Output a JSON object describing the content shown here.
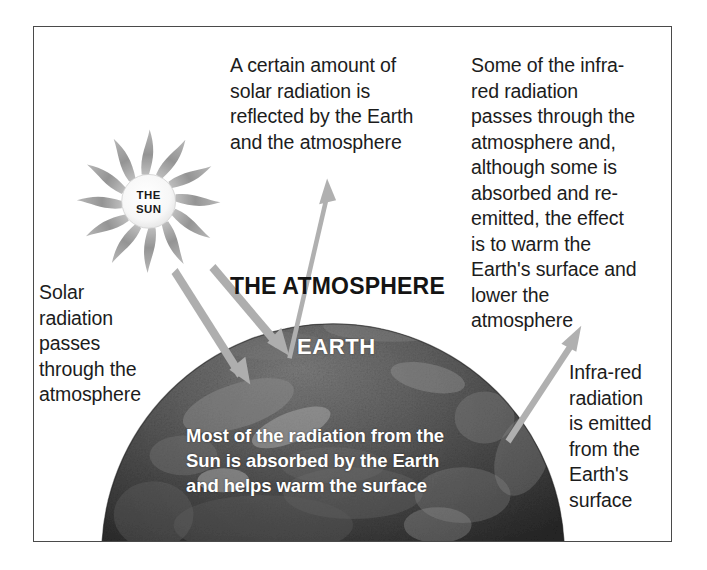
{
  "diagram": {
    "frame": {
      "border_color": "#4a4a4a",
      "background": "#ffffff"
    },
    "sun": {
      "name": "the-sun",
      "line1": "THE",
      "line2": "SUN",
      "ray_count": 12,
      "ray_color": "#9a9a9a",
      "disc_color": "#fbfbfb"
    },
    "earth": {
      "name": "earth-globe",
      "label": "EARTH",
      "base_color": "#4d4d4d",
      "shadow_color": "#2a2a2a",
      "highlight_color": "#bdbdbd"
    },
    "atmosphere_label": "THE ATMOSPHERE",
    "captions": {
      "reflected": "A certain amount of\nsolar radiation is\nreflected by the Earth\nand the atmosphere",
      "infrared_through": "Some of the infra-\nred radiation\npasses through the\natmosphere and,\nalthough some is\nabsorbed and re-\nemitted, the effect\nis to warm the\nEarth's surface and\nlower the\natmosphere",
      "solar_passes": "Solar\nradiation\npasses\nthrough the\natmosphere",
      "infrared_emitted": "Infra-red\nradiation\nis emitted\nfrom the\nEarth's\nsurface",
      "absorbed_overlay": "Most of the radiation from the\nSun is absorbed by the Earth\nand helps warm the surface"
    },
    "arrows": [
      {
        "name": "incoming-solar-arrow-1",
        "direction": "down-right",
        "color": "#a8a8a8"
      },
      {
        "name": "incoming-solar-arrow-2",
        "direction": "down-right",
        "color": "#a8a8a8"
      },
      {
        "name": "reflected-radiation-arrow",
        "direction": "up-right",
        "color": "#a8a8a8"
      },
      {
        "name": "infrared-emission-arrow",
        "direction": "up-right",
        "color": "#a8a8a8"
      }
    ],
    "colors": {
      "text": "#1c1c1c",
      "overlay_text": "#ffffff",
      "arrow": "#a8a8a8",
      "frame": "#4a4a4a"
    }
  }
}
